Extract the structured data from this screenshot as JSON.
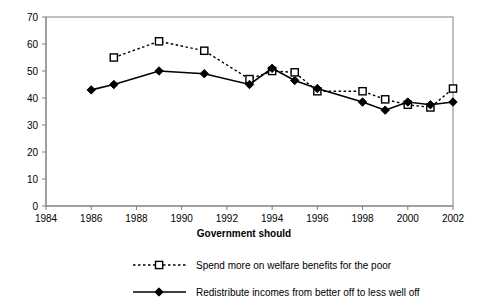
{
  "chart_data": {
    "type": "line",
    "title": "",
    "xlabel": "Government should",
    "ylabel": "",
    "xlim": [
      1984,
      2002
    ],
    "ylim": [
      0,
      70
    ],
    "grid": false,
    "legend_position": "bottom",
    "x_ticks": [
      "1984",
      "1986",
      "1988",
      "1990",
      "1992",
      "1994",
      "1996",
      "1998",
      "2000",
      "2002"
    ],
    "y_ticks": [
      "0",
      "10",
      "20",
      "30",
      "40",
      "50",
      "60",
      "70"
    ],
    "series": [
      {
        "name": "Spend more on welfare benefits for the poor",
        "marker": "open-square",
        "line_style": "dotted",
        "x": [
          1987,
          1989,
          1991,
          1993,
          1994,
          1995,
          1996,
          1998,
          1999,
          2000,
          2001,
          2002
        ],
        "values": [
          55,
          61,
          57.5,
          47,
          50,
          49.5,
          42.5,
          42.5,
          39.5,
          37.5,
          36.5,
          43.5
        ]
      },
      {
        "name": "Redistribute incomes from better off to less well off",
        "marker": "filled-diamond",
        "line_style": "solid",
        "x": [
          1986,
          1987,
          1989,
          1991,
          1993,
          1994,
          1995,
          1996,
          1998,
          1999,
          2000,
          2001,
          2002
        ],
        "values": [
          43,
          45,
          50,
          49,
          45,
          51,
          46.5,
          43.5,
          38.5,
          35.5,
          38.5,
          37.5,
          38.5
        ]
      }
    ]
  },
  "axis": {
    "x_title": "Government should"
  },
  "legend": {
    "entries": [
      {
        "label": "Spend more on welfare benefits for the poor"
      },
      {
        "label": "Redistribute incomes from better off to less well off"
      }
    ]
  },
  "colors": {
    "series_line": "#000000",
    "frame": "#808080",
    "background": "#ffffff"
  }
}
